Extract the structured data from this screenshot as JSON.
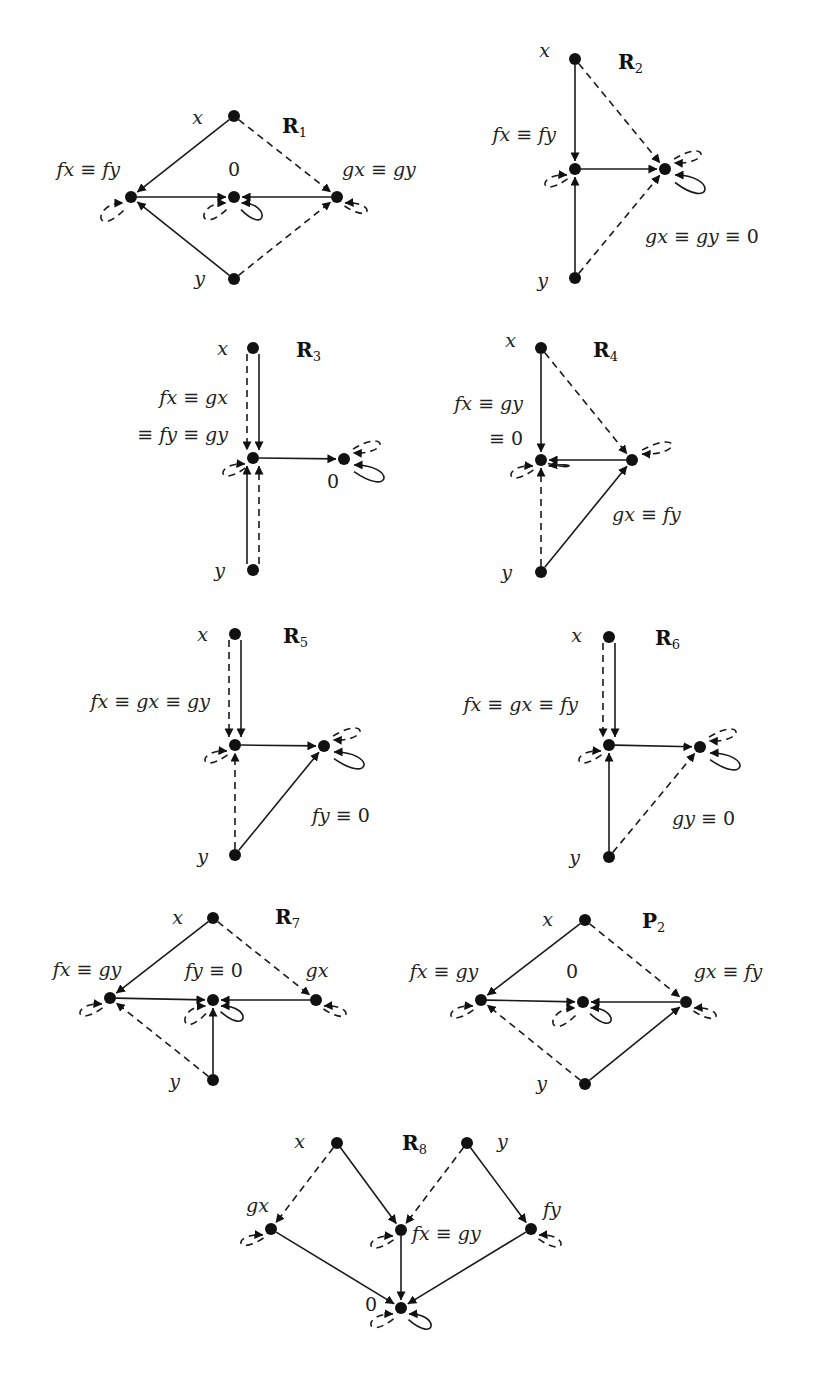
{
  "figure": {
    "diagrams": [
      {
        "id": "R1",
        "title": "R",
        "subscript": "1",
        "nodes": [
          {
            "id": "x",
            "label": "x"
          },
          {
            "id": "a",
            "label": "fx ≡ fy"
          },
          {
            "id": "z",
            "label": "0"
          },
          {
            "id": "b",
            "label": "gx ≡ gy"
          },
          {
            "id": "y",
            "label": "y"
          }
        ],
        "edges": [
          {
            "from": "x",
            "to": "a",
            "style": "solid"
          },
          {
            "from": "x",
            "to": "b",
            "style": "dashed"
          },
          {
            "from": "y",
            "to": "a",
            "style": "solid"
          },
          {
            "from": "y",
            "to": "b",
            "style": "dashed"
          },
          {
            "from": "a",
            "to": "z",
            "style": "solid"
          },
          {
            "from": "b",
            "to": "z",
            "style": "solid"
          }
        ],
        "loops": [
          {
            "node": "a",
            "style": "dashed"
          },
          {
            "node": "z",
            "style": "dashed"
          },
          {
            "node": "z",
            "style": "solid"
          },
          {
            "node": "b",
            "style": "dashed"
          }
        ]
      },
      {
        "id": "R2",
        "title": "R",
        "subscript": "2",
        "nodes": [
          {
            "id": "x",
            "label": "x"
          },
          {
            "id": "a",
            "label": "fx ≡ fy"
          },
          {
            "id": "z",
            "label": "gx ≡ gy ≡ 0"
          },
          {
            "id": "y",
            "label": "y"
          }
        ],
        "edges": [
          {
            "from": "x",
            "to": "a",
            "style": "solid"
          },
          {
            "from": "x",
            "to": "z",
            "style": "dashed"
          },
          {
            "from": "y",
            "to": "a",
            "style": "solid"
          },
          {
            "from": "y",
            "to": "z",
            "style": "dashed"
          },
          {
            "from": "a",
            "to": "z",
            "style": "solid"
          }
        ],
        "loops": [
          {
            "node": "a",
            "style": "dashed"
          },
          {
            "node": "z",
            "style": "dashed"
          },
          {
            "node": "z",
            "style": "solid"
          }
        ]
      },
      {
        "id": "R3",
        "title": "R",
        "subscript": "3",
        "nodes": [
          {
            "id": "x",
            "label": "x"
          },
          {
            "id": "a",
            "label": "fx ≡ gx",
            "label2": "≡ fy ≡ gy"
          },
          {
            "id": "z",
            "label": "0"
          },
          {
            "id": "y",
            "label": "y"
          }
        ],
        "edges": [
          {
            "from": "x",
            "to": "a",
            "style": "solid"
          },
          {
            "from": "x",
            "to": "a",
            "style": "dashed"
          },
          {
            "from": "y",
            "to": "a",
            "style": "solid"
          },
          {
            "from": "y",
            "to": "a",
            "style": "dashed"
          },
          {
            "from": "a",
            "to": "z",
            "style": "solid"
          }
        ],
        "loops": [
          {
            "node": "a",
            "style": "dashed"
          },
          {
            "node": "z",
            "style": "dashed"
          },
          {
            "node": "z",
            "style": "solid"
          }
        ]
      },
      {
        "id": "R4",
        "title": "R",
        "subscript": "4",
        "nodes": [
          {
            "id": "x",
            "label": "x"
          },
          {
            "id": "z",
            "label": "fx ≡ gy",
            "label2": "≡ 0"
          },
          {
            "id": "b",
            "label": "gx ≡ fy"
          },
          {
            "id": "y",
            "label": "y"
          }
        ],
        "edges": [
          {
            "from": "x",
            "to": "z",
            "style": "solid"
          },
          {
            "from": "x",
            "to": "b",
            "style": "dashed"
          },
          {
            "from": "y",
            "to": "z",
            "style": "dashed"
          },
          {
            "from": "y",
            "to": "b",
            "style": "solid"
          },
          {
            "from": "b",
            "to": "z",
            "style": "solid"
          }
        ],
        "loops": [
          {
            "node": "z",
            "style": "dashed"
          },
          {
            "node": "z",
            "style": "solid"
          },
          {
            "node": "b",
            "style": "dashed"
          }
        ]
      },
      {
        "id": "R5",
        "title": "R",
        "subscript": "5",
        "nodes": [
          {
            "id": "x",
            "label": "x"
          },
          {
            "id": "a",
            "label": "fx ≡ gx ≡ gy"
          },
          {
            "id": "z",
            "label": "fy ≡ 0"
          },
          {
            "id": "y",
            "label": "y"
          }
        ],
        "edges": [
          {
            "from": "x",
            "to": "a",
            "style": "solid"
          },
          {
            "from": "x",
            "to": "a",
            "style": "dashed"
          },
          {
            "from": "y",
            "to": "a",
            "style": "dashed"
          },
          {
            "from": "y",
            "to": "z",
            "style": "solid"
          },
          {
            "from": "a",
            "to": "z",
            "style": "solid"
          }
        ],
        "loops": [
          {
            "node": "a",
            "style": "dashed"
          },
          {
            "node": "z",
            "style": "dashed"
          },
          {
            "node": "z",
            "style": "solid"
          }
        ]
      },
      {
        "id": "R6",
        "title": "R",
        "subscript": "6",
        "nodes": [
          {
            "id": "x",
            "label": "x"
          },
          {
            "id": "a",
            "label": "fx ≡ gx ≡ fy"
          },
          {
            "id": "z",
            "label": "gy ≡ 0"
          },
          {
            "id": "y",
            "label": "y"
          }
        ],
        "edges": [
          {
            "from": "x",
            "to": "a",
            "style": "solid"
          },
          {
            "from": "x",
            "to": "a",
            "style": "dashed"
          },
          {
            "from": "y",
            "to": "a",
            "style": "solid"
          },
          {
            "from": "y",
            "to": "z",
            "style": "dashed"
          },
          {
            "from": "a",
            "to": "z",
            "style": "solid"
          }
        ],
        "loops": [
          {
            "node": "a",
            "style": "dashed"
          },
          {
            "node": "z",
            "style": "dashed"
          },
          {
            "node": "z",
            "style": "solid"
          }
        ]
      },
      {
        "id": "R7",
        "title": "R",
        "subscript": "7",
        "nodes": [
          {
            "id": "x",
            "label": "x"
          },
          {
            "id": "a",
            "label": "fx ≡ gy"
          },
          {
            "id": "z",
            "label": "fy ≡ 0"
          },
          {
            "id": "b",
            "label": "gx"
          },
          {
            "id": "y",
            "label": "y"
          }
        ],
        "edges": [
          {
            "from": "x",
            "to": "a",
            "style": "solid"
          },
          {
            "from": "x",
            "to": "b",
            "style": "dashed"
          },
          {
            "from": "y",
            "to": "a",
            "style": "dashed"
          },
          {
            "from": "y",
            "to": "z",
            "style": "solid"
          },
          {
            "from": "a",
            "to": "z",
            "style": "solid"
          },
          {
            "from": "b",
            "to": "z",
            "style": "solid"
          }
        ],
        "loops": [
          {
            "node": "a",
            "style": "dashed"
          },
          {
            "node": "z",
            "style": "dashed"
          },
          {
            "node": "z",
            "style": "solid"
          },
          {
            "node": "b",
            "style": "dashed"
          }
        ]
      },
      {
        "id": "P2",
        "title": "P",
        "subscript": "2",
        "nodes": [
          {
            "id": "x",
            "label": "x"
          },
          {
            "id": "a",
            "label": "fx ≡ gy"
          },
          {
            "id": "z",
            "label": "0"
          },
          {
            "id": "b",
            "label": "gx ≡ fy"
          },
          {
            "id": "y",
            "label": "y"
          }
        ],
        "edges": [
          {
            "from": "x",
            "to": "a",
            "style": "solid"
          },
          {
            "from": "x",
            "to": "b",
            "style": "dashed"
          },
          {
            "from": "y",
            "to": "a",
            "style": "dashed"
          },
          {
            "from": "y",
            "to": "b",
            "style": "solid"
          },
          {
            "from": "a",
            "to": "z",
            "style": "solid"
          },
          {
            "from": "b",
            "to": "z",
            "style": "solid"
          }
        ],
        "loops": [
          {
            "node": "a",
            "style": "dashed"
          },
          {
            "node": "z",
            "style": "dashed"
          },
          {
            "node": "z",
            "style": "solid"
          },
          {
            "node": "b",
            "style": "dashed"
          }
        ]
      },
      {
        "id": "R8",
        "title": "R",
        "subscript": "8",
        "nodes": [
          {
            "id": "x",
            "label": "x"
          },
          {
            "id": "y",
            "label": "y"
          },
          {
            "id": "gx",
            "label": "gx"
          },
          {
            "id": "m",
            "label": "fx ≡ gy"
          },
          {
            "id": "fy",
            "label": "fy"
          },
          {
            "id": "z",
            "label": "0"
          }
        ],
        "edges": [
          {
            "from": "x",
            "to": "gx",
            "style": "dashed"
          },
          {
            "from": "x",
            "to": "m",
            "style": "solid"
          },
          {
            "from": "y",
            "to": "m",
            "style": "dashed"
          },
          {
            "from": "y",
            "to": "fy",
            "style": "solid"
          },
          {
            "from": "gx",
            "to": "z",
            "style": "solid"
          },
          {
            "from": "m",
            "to": "z",
            "style": "solid"
          },
          {
            "from": "fy",
            "to": "z",
            "style": "solid"
          }
        ],
        "loops": [
          {
            "node": "gx",
            "style": "dashed"
          },
          {
            "node": "m",
            "style": "dashed"
          },
          {
            "node": "fy",
            "style": "dashed"
          },
          {
            "node": "z",
            "style": "dashed"
          },
          {
            "node": "z",
            "style": "solid"
          }
        ]
      }
    ]
  }
}
